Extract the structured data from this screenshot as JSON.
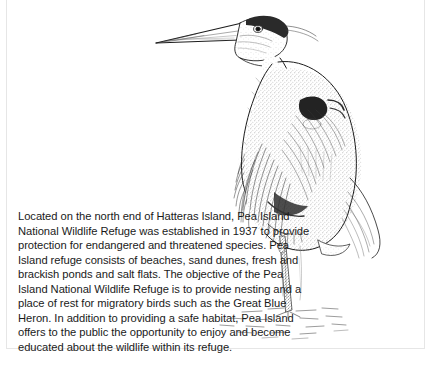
{
  "document": {
    "type": "illustrated-page",
    "background_color": "#ffffff",
    "border_color": "#e6e6e6"
  },
  "illustration": {
    "name": "great-blue-heron-drawing",
    "subject": "Great Blue Heron",
    "style": "pen-and-ink stippled line drawing",
    "ink_color": "#1c1c1c",
    "description": "A Great Blue Heron standing in shallow water, shown in profile facing left, with long pointed beak, dark crown stripe, S-curved neck, plumed breast and wing feathers, and long legs in water."
  },
  "caption": {
    "text": "Located on the north end of Hatteras Island, Pea Island National Wildlife Refuge was established in 1937 to provide protection for endangered and threatened species. Pea Island refuge consists of beaches, sand dunes, fresh and brackish ponds and salt flats. The objective of the Pea Island National Wildlife Refuge is to provide nesting and a place of rest for migratory birds such as the Great Blue Heron. In addition to providing a safe habitat, Pea Island offers to the public the opportunity to enjoy and become educated about the wildlife within its refuge.",
    "text_color": "#1a1a1a",
    "lines": [
      "Located on the north end of Hatteras Island, Pea",
      "Island National Wildlife Refuge was established in 1937 to provide",
      "protection for endangered and threatened species. Pea",
      "Island refuge consists of beaches, sand dunes, fresh and",
      "brackish ponds and salt flats. The objective of the Pea Island",
      "National Wildlife Refuge is to provide nesting and a place of",
      "rest for migratory birds such as the Great Blue Heron. In",
      "addition to providing a safe habitat, Pea Island offers to the",
      "public the opportunity to enjoy and become educated",
      "about the wildlife within its refuge."
    ]
  }
}
